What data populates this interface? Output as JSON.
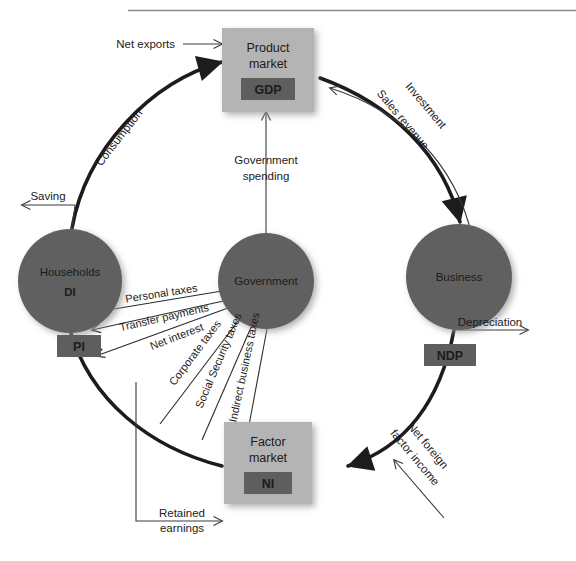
{
  "diagram": {
    "type": "circular-flow",
    "colors": {
      "circle_fill": "#616161",
      "box_fill": "#b4b4b4",
      "chip_fill": "#5e5e5e",
      "chip_text": "#ffffff",
      "flow_thick": "#1c1c1c",
      "flow_thin": "#3a3a3a",
      "rule": "#8d8d8d",
      "label_text": "#1b1b1b"
    },
    "top_rule": {
      "x1": 128,
      "x2": 576,
      "y": 10
    }
  },
  "nodes": {
    "product_market": {
      "label_line1": "Product",
      "label_line2": "market",
      "chip": "GDP"
    },
    "factor_market": {
      "label_line1": "Factor",
      "label_line2": "market",
      "chip": "NI"
    },
    "households": {
      "label": "Households",
      "chip": "DI"
    },
    "government": {
      "label": "Government"
    },
    "business": {
      "label": "Business",
      "chip": "NDP"
    },
    "pi_chip": {
      "chip": "PI"
    }
  },
  "flows": {
    "net_exports": "Net exports",
    "consumption": "Consumption",
    "saving": "Saving",
    "government_spending_line1": "Government",
    "government_spending_line2": "spending",
    "investment": "Investment",
    "sales_revenue": "Sales revenue",
    "depreciation": "Depreciation",
    "net_foreign_factor_income_line1": "Net foreign",
    "net_foreign_factor_income_line2": "factor income",
    "retained_earnings_line1": "Retained",
    "retained_earnings_line2": "earnings"
  },
  "tax_flows": [
    {
      "label": "Personal taxes"
    },
    {
      "label": "Transfer payments"
    },
    {
      "label": "Net interest"
    },
    {
      "label": "Corporate taxes"
    },
    {
      "label": "Social Security taxes"
    },
    {
      "label": "Indirect business taxes"
    }
  ]
}
